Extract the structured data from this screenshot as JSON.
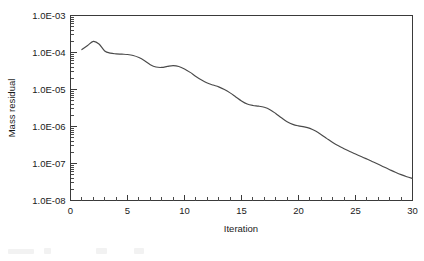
{
  "chart_data": {
    "type": "line",
    "title": "",
    "xlabel": "Iteration",
    "ylabel": "Mass residual",
    "xscale": "linear",
    "yscale": "log",
    "xlim": [
      0,
      30
    ],
    "ylim": [
      1e-08,
      0.001
    ],
    "grid": false,
    "legend": null,
    "x_ticks": [
      0,
      5,
      10,
      15,
      20,
      25,
      30
    ],
    "x_tick_labels": [
      "0",
      "5",
      "10",
      "15",
      "20",
      "25",
      "30"
    ],
    "x_minor_tick_step": 1,
    "y_ticks": [
      0.001,
      0.0001,
      1e-05,
      1e-06,
      1e-07,
      1e-08
    ],
    "y_tick_labels": [
      "1.0E-03",
      "1.0E-04",
      "1.0E-05",
      "1.0E-06",
      "1.0E-07",
      "1.0E-08"
    ],
    "y_minor_ticks": "log decades 2-9",
    "series": [
      {
        "name": "Mass residual",
        "color": "#4a4a4a",
        "x": [
          1,
          1.5,
          2,
          2.5,
          3,
          3.5,
          4,
          4.5,
          5,
          5.5,
          6,
          6.5,
          7,
          7.5,
          8,
          8.5,
          9,
          9.5,
          10,
          10.5,
          11,
          11.5,
          12,
          12.5,
          13,
          13.5,
          14,
          14.5,
          15,
          15.5,
          16,
          16.5,
          17,
          17.5,
          18,
          18.5,
          19,
          19.5,
          20,
          20.5,
          21,
          21.5,
          22,
          22.5,
          23,
          23.5,
          24,
          24.5,
          25,
          25.5,
          26,
          26.5,
          27,
          27.5,
          28,
          28.5,
          29,
          29.5,
          30
        ],
        "y": [
          0.00012,
          0.000155,
          0.0002,
          0.00017,
          0.00011,
          9.6e-05,
          9.2e-05,
          9e-05,
          8.8e-05,
          8.3e-05,
          7.3e-05,
          6e-05,
          4.7e-05,
          4.05e-05,
          3.95e-05,
          4.2e-05,
          4.4e-05,
          4.2e-05,
          3.6e-05,
          2.9e-05,
          2.25e-05,
          1.8e-05,
          1.5e-05,
          1.32e-05,
          1.18e-05,
          1e-05,
          8.1e-06,
          6.3e-06,
          4.9e-06,
          4.05e-06,
          3.7e-06,
          3.55e-06,
          3.3e-06,
          2.85e-06,
          2.25e-06,
          1.72e-06,
          1.35e-06,
          1.14e-06,
          1.04e-06,
          9.8e-07,
          8.9e-07,
          7.5e-07,
          6e-07,
          4.7e-07,
          3.7e-07,
          3e-07,
          2.5e-07,
          2.1e-07,
          1.8e-07,
          1.55e-07,
          1.32e-07,
          1.12e-07,
          9.5e-08,
          8e-08,
          6.8e-08,
          5.8e-08,
          5e-08,
          4.4e-08,
          3.95e-08
        ]
      }
    ],
    "key_points": {
      "start_value": 0.00012,
      "peak_iteration": 2,
      "peak_value": 0.0002,
      "end_iteration": 30,
      "end_value": 3.95e-08,
      "decades_reduced": 3.7
    },
    "colors": {
      "line": "#4a4a4a",
      "axis": "#3a3a3a",
      "text": "#1a1a1a",
      "background": "#ffffff"
    }
  }
}
